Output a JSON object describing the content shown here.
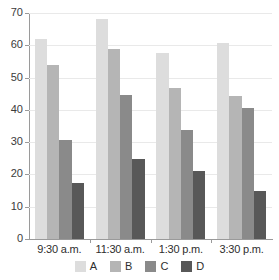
{
  "chart_data": {
    "type": "bar",
    "title": "",
    "subtitle": "",
    "xlabel": "",
    "ylabel": "",
    "categories": [
      "9:30 a.m.",
      "11:30 a.m.",
      "1:30 p.m.",
      "3:30 p.m."
    ],
    "series": [
      {
        "name": "A",
        "color": "#dddddd",
        "values": [
          61.8,
          68.0,
          57.7,
          60.6
        ]
      },
      {
        "name": "B",
        "color": "#b5b5b5",
        "values": [
          53.8,
          59.0,
          46.7,
          44.3
        ]
      },
      {
        "name": "C",
        "color": "#8a8a8a",
        "values": [
          30.8,
          44.6,
          33.8,
          40.5
        ]
      },
      {
        "name": "D",
        "color": "#585858",
        "values": [
          17.3,
          24.7,
          21.2,
          14.8
        ]
      }
    ],
    "ylim": [
      0,
      70
    ],
    "yticks": [
      0,
      10,
      20,
      30,
      40,
      50,
      60,
      70
    ],
    "ytick_labels": [
      "0",
      "10",
      "20",
      "30",
      "40",
      "50",
      "60",
      "70"
    ],
    "grid": true,
    "grid_axis": "y",
    "legend_position": "bottom",
    "legend_entries": [
      "A",
      "B",
      "C",
      "D"
    ]
  }
}
